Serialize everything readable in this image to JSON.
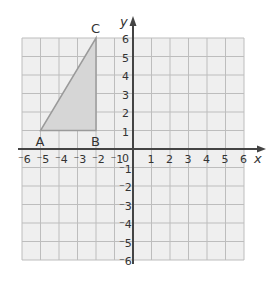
{
  "diagram": {
    "type": "coordinate-grid",
    "x_axis": {
      "label": "x",
      "min": -6,
      "max": 6,
      "ticks": [
        "-6",
        "-5",
        "-4",
        "-3",
        "-2",
        "-1",
        "1",
        "2",
        "3",
        "4",
        "5",
        "6"
      ]
    },
    "y_axis": {
      "label": "y",
      "min": -6,
      "max": 6,
      "ticks": [
        "6",
        "5",
        "4",
        "3",
        "2",
        "1",
        "-1",
        "-2",
        "-3",
        "-4",
        "-5",
        "-6"
      ]
    },
    "origin_label": "0",
    "triangle": {
      "vertices": [
        {
          "label": "A",
          "x": -5,
          "y": 1
        },
        {
          "label": "B",
          "x": -2,
          "y": 1
        },
        {
          "label": "C",
          "x": -2,
          "y": 6
        }
      ],
      "fill": "#d6d6d6",
      "stroke": "#9a9a9a"
    },
    "colors": {
      "grid_bg": "#efefef",
      "grid_line": "#bdbdbd",
      "axis": "#444444"
    }
  }
}
